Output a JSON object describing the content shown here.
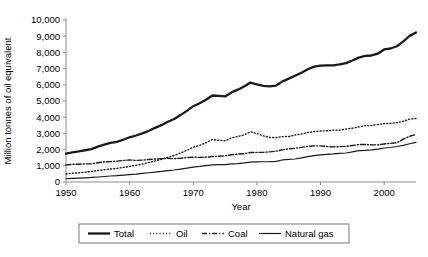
{
  "chart_data": {
    "type": "line",
    "title": "",
    "xlabel": "Year",
    "ylabel": "Million tonnes of oil equivalent",
    "xlim": [
      1950,
      2005
    ],
    "ylim": [
      0,
      10000
    ],
    "grid": false,
    "legend_position": "bottom",
    "x_ticks": [
      1950,
      1960,
      1970,
      1980,
      1990,
      2000
    ],
    "x_tick_labels": [
      "1950",
      "1960",
      "1970",
      "1980",
      "1990",
      "2000"
    ],
    "y_ticks": [
      0,
      1000,
      2000,
      3000,
      4000,
      5000,
      6000,
      7000,
      8000,
      9000,
      10000
    ],
    "y_tick_labels": [
      "0",
      "1,000",
      "2,000",
      "3,000",
      "4,000",
      "5,000",
      "6,000",
      "7,000",
      "8,000",
      "9,000",
      "10,000"
    ],
    "x": [
      1950,
      1951,
      1952,
      1953,
      1954,
      1955,
      1956,
      1957,
      1958,
      1959,
      1960,
      1961,
      1962,
      1963,
      1964,
      1965,
      1966,
      1967,
      1968,
      1969,
      1970,
      1971,
      1972,
      1973,
      1974,
      1975,
      1976,
      1977,
      1978,
      1979,
      1980,
      1981,
      1982,
      1983,
      1984,
      1985,
      1986,
      1987,
      1988,
      1989,
      1990,
      1991,
      1992,
      1993,
      1994,
      1995,
      1996,
      1997,
      1998,
      1999,
      2000,
      2001,
      2002,
      2003,
      2004,
      2005
    ],
    "series": [
      {
        "name": "Total",
        "style": "solid-thick",
        "color": "#1a1a1a",
        "width": 2.3,
        "values": [
          1750,
          1830,
          1890,
          1960,
          2030,
          2180,
          2310,
          2410,
          2480,
          2610,
          2760,
          2870,
          3000,
          3160,
          3340,
          3510,
          3720,
          3890,
          4130,
          4390,
          4680,
          4860,
          5080,
          5340,
          5320,
          5280,
          5530,
          5700,
          5900,
          6140,
          6020,
          5930,
          5900,
          5950,
          6200,
          6380,
          6560,
          6740,
          6960,
          7120,
          7180,
          7200,
          7200,
          7260,
          7340,
          7500,
          7680,
          7780,
          7810,
          7920,
          8180,
          8240,
          8380,
          8680,
          9020,
          9230
        ]
      },
      {
        "name": "Oil",
        "style": "dotted",
        "color": "#3a3a3a",
        "width": 1.4,
        "values": [
          500,
          540,
          570,
          610,
          650,
          710,
          760,
          800,
          840,
          900,
          960,
          1030,
          1110,
          1200,
          1300,
          1400,
          1520,
          1640,
          1790,
          1960,
          2150,
          2260,
          2420,
          2620,
          2580,
          2540,
          2720,
          2810,
          2910,
          3100,
          2990,
          2850,
          2760,
          2740,
          2800,
          2810,
          2900,
          2960,
          3060,
          3110,
          3150,
          3160,
          3200,
          3200,
          3270,
          3320,
          3400,
          3470,
          3490,
          3550,
          3600,
          3620,
          3660,
          3750,
          3880,
          3920
        ]
      },
      {
        "name": "Coal",
        "style": "dash-dot",
        "color": "#3a3a3a",
        "width": 1.4,
        "values": [
          1050,
          1090,
          1100,
          1120,
          1120,
          1190,
          1240,
          1260,
          1290,
          1330,
          1360,
          1330,
          1350,
          1390,
          1420,
          1440,
          1460,
          1440,
          1470,
          1510,
          1530,
          1520,
          1530,
          1570,
          1590,
          1620,
          1680,
          1720,
          1750,
          1820,
          1830,
          1830,
          1860,
          1900,
          1980,
          2050,
          2080,
          2140,
          2200,
          2230,
          2230,
          2190,
          2170,
          2180,
          2200,
          2250,
          2310,
          2320,
          2300,
          2290,
          2350,
          2380,
          2430,
          2640,
          2820,
          2930
        ]
      },
      {
        "name": "Natural gas",
        "style": "solid-thin",
        "color": "#4a4a4a",
        "width": 1.2,
        "values": [
          200,
          220,
          240,
          260,
          280,
          310,
          340,
          370,
          390,
          430,
          460,
          490,
          530,
          570,
          610,
          650,
          700,
          740,
          800,
          860,
          920,
          960,
          1010,
          1060,
          1070,
          1070,
          1120,
          1140,
          1180,
          1230,
          1240,
          1250,
          1250,
          1270,
          1360,
          1400,
          1420,
          1490,
          1570,
          1630,
          1670,
          1710,
          1730,
          1770,
          1790,
          1860,
          1940,
          1950,
          1980,
          2030,
          2100,
          2130,
          2190,
          2260,
          2360,
          2450
        ]
      }
    ]
  },
  "legend": {
    "items": [
      {
        "label": "Total",
        "style": "solid-thick"
      },
      {
        "label": "Oil",
        "style": "dotted"
      },
      {
        "label": "Coal",
        "style": "dash-dot"
      },
      {
        "label": "Natural gas",
        "style": "solid-thin"
      }
    ]
  }
}
